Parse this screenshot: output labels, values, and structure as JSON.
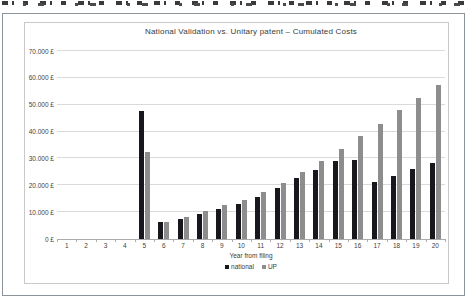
{
  "figure": {
    "title": "National Validation vs. Unitary patent – Cumulated Costs"
  },
  "chart_data": {
    "type": "bar",
    "title": "National Validation vs. Unitary patent – Cumulated Costs",
    "xlabel": "Year from filing",
    "ylabel": "",
    "categories": [
      "1",
      "2",
      "3",
      "4",
      "5",
      "6",
      "7",
      "8",
      "9",
      "10",
      "11",
      "12",
      "13",
      "14",
      "15",
      "16",
      "17",
      "18",
      "19",
      "20"
    ],
    "series": [
      {
        "name": "national",
        "color": "#17171d",
        "values": [
          null,
          null,
          null,
          null,
          47500,
          6500,
          7500,
          9400,
          11300,
          13100,
          15500,
          18900,
          22700,
          25700,
          29000,
          29400,
          21400,
          23500,
          26000,
          28400
        ]
      },
      {
        "name": "UP",
        "color": "#8d8d8d",
        "values": [
          null,
          null,
          null,
          null,
          32300,
          6500,
          8300,
          10500,
          12600,
          14600,
          17600,
          21000,
          24900,
          29000,
          33500,
          38500,
          43000,
          48000,
          52500,
          57300
        ]
      }
    ],
    "ylim": [
      0,
      70000
    ],
    "ytick_step": 10000,
    "ytick_labels": [
      "0 £",
      "10.000 £",
      "20.000 £",
      "30.000 £",
      "40.000 £",
      "50.000 £",
      "60.000 £",
      "70.000 £"
    ],
    "grid": true,
    "legend_position": "bottom"
  }
}
